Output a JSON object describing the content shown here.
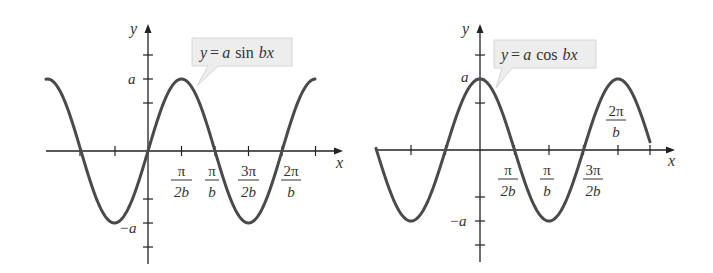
{
  "graphs": [
    {
      "equation": "y = a sin bx",
      "eq_parts": {
        "y": "y",
        "eq": "=",
        "a": "a",
        "fn": "sin",
        "bx": "bx"
      },
      "axis_x": "x",
      "axis_y": "y",
      "y_labels": {
        "top": "a",
        "bottom": "−a"
      },
      "x_labels": [
        {
          "num": "π",
          "den": "2b"
        },
        {
          "num": "π",
          "den": "b"
        },
        {
          "num": "3π",
          "den": "2b"
        },
        {
          "num": "2π",
          "den": "b"
        }
      ]
    },
    {
      "equation": "y = a cos bx",
      "eq_parts": {
        "y": "y",
        "eq": "=",
        "a": "a",
        "fn": "cos",
        "bx": "bx"
      },
      "axis_x": "x",
      "axis_y": "y",
      "y_labels": {
        "top": "a",
        "bottom": "−a"
      },
      "x_labels": [
        {
          "num": "π",
          "den": "2b"
        },
        {
          "num": "π",
          "den": "b"
        },
        {
          "num": "3π",
          "den": "2b"
        },
        {
          "num": "2π",
          "den": "b"
        }
      ]
    }
  ],
  "colors": {
    "curve": "#4a4a4a",
    "axis": "#222222",
    "callout_bg": "#ededed",
    "callout_border": "#d0d0d0"
  }
}
